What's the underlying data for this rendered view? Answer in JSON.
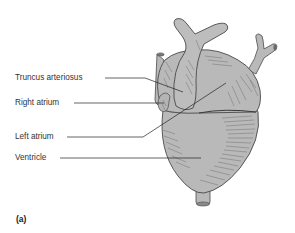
{
  "figure": {
    "caption": "(a)",
    "colors": {
      "fill": "#b9b9b9",
      "outline": "#4a4a4a",
      "hatch": "#6a6a6a",
      "leader": "#222222",
      "text": "#333333"
    },
    "labels": [
      {
        "id": "truncus-arteriosus",
        "text": "Truncus arteriosus"
      },
      {
        "id": "right-atrium",
        "text": "Right atrium"
      },
      {
        "id": "left-atrium",
        "text": "Left atrium"
      },
      {
        "id": "ventricle",
        "text": "Ventricle"
      }
    ]
  }
}
